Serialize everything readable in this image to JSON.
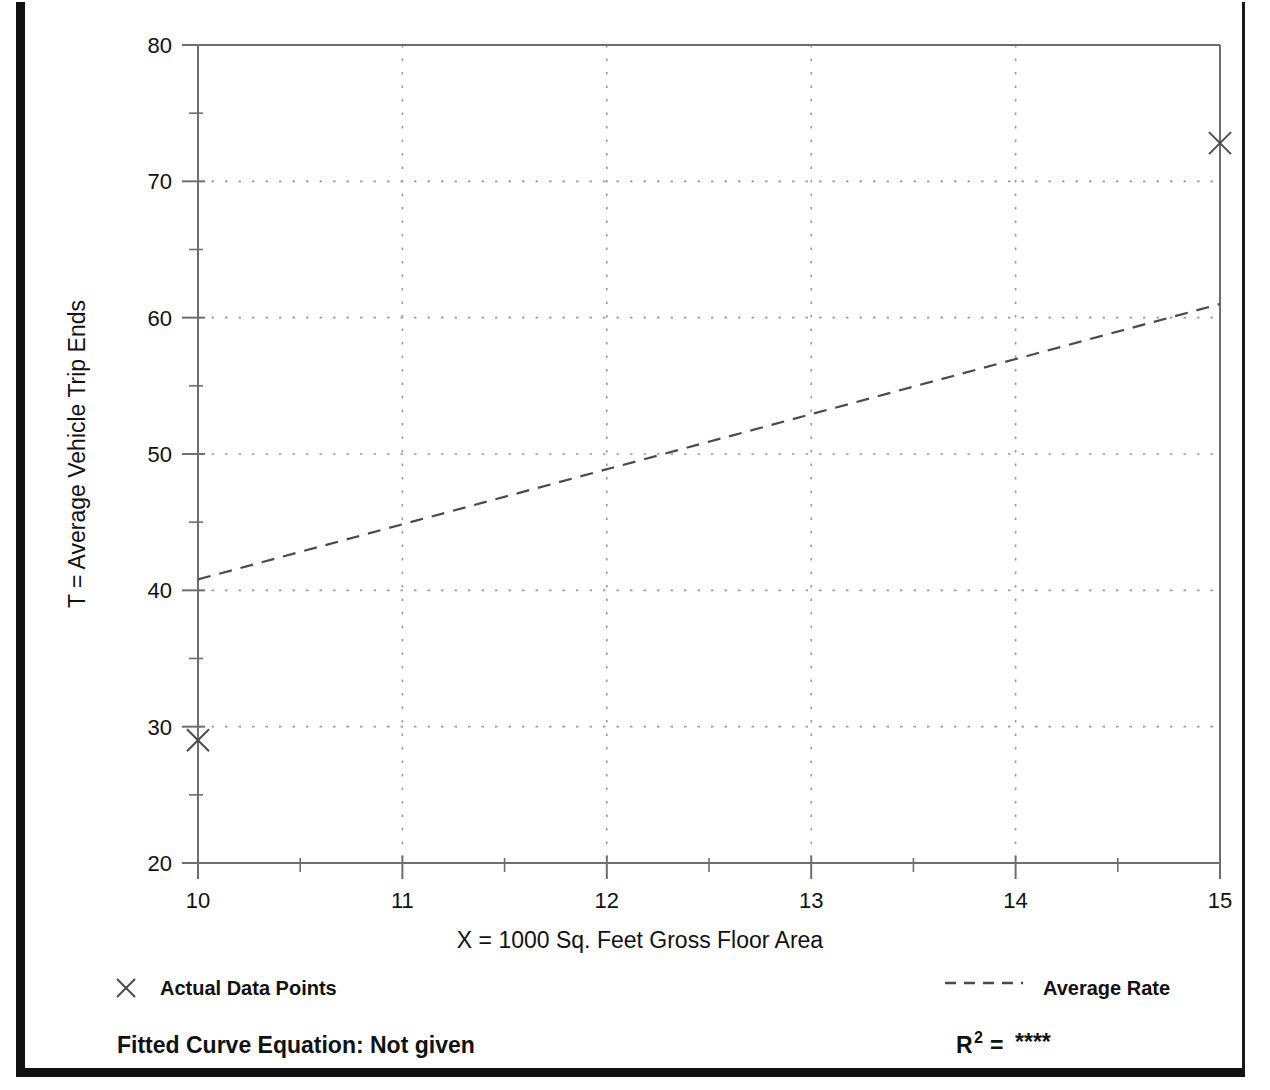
{
  "chart_data": {
    "type": "scatter",
    "title": "",
    "xlabel": "X = 1000 Sq. Feet Gross Floor Area",
    "ylabel": "T = Average Vehicle Trip Ends",
    "xlim": [
      10,
      15
    ],
    "ylim": [
      20,
      80
    ],
    "x_ticks": [
      10,
      11,
      12,
      13,
      14,
      15
    ],
    "x_tick_labels": [
      "10",
      "11",
      "12",
      "13",
      "14",
      "15"
    ],
    "x_minor_ticks": [
      10.5,
      11.5,
      12.5,
      13.5,
      14.5
    ],
    "y_ticks": [
      20,
      30,
      40,
      50,
      60,
      70,
      80
    ],
    "y_tick_labels": [
      "20",
      "30",
      "40",
      "50",
      "60",
      "70",
      "80"
    ],
    "y_minor_ticks": [
      25,
      35,
      45,
      55,
      65,
      75
    ],
    "grid": true,
    "grid_style": "dotted",
    "grid_color": "#9a9a9a",
    "axis_color": "#6e6e6e",
    "series": [
      {
        "name": "Actual Data Points",
        "type": "scatter",
        "marker": "x",
        "color": "#4a4a4a",
        "points": [
          {
            "x": 10,
            "y": 29
          },
          {
            "x": 15,
            "y": 72.8
          }
        ]
      },
      {
        "name": "Average Rate",
        "type": "line",
        "linestyle": "dashed",
        "color": "#4a4a4a",
        "points": [
          {
            "x": 10,
            "y": 40.8
          },
          {
            "x": 15,
            "y": 61
          }
        ]
      }
    ],
    "legend_position": "below-plot"
  },
  "legend": {
    "data_points_label": "Actual Data Points",
    "data_points_marker": "x-marker-icon",
    "average_rate_label": "Average Rate",
    "average_rate_marker": "dashed-line-icon"
  },
  "footer": {
    "fitted_curve_label": "Fitted Curve Equation:  Not given",
    "r_squared_base": "R",
    "r_squared_exponent": "2",
    "r_squared_equals": "=",
    "r_squared_value": "****"
  },
  "colors": {
    "frame": "#111111",
    "grid": "#9a9a9a",
    "axis": "#6e6e6e",
    "ink": "#111111",
    "data": "#4a4a4a"
  }
}
